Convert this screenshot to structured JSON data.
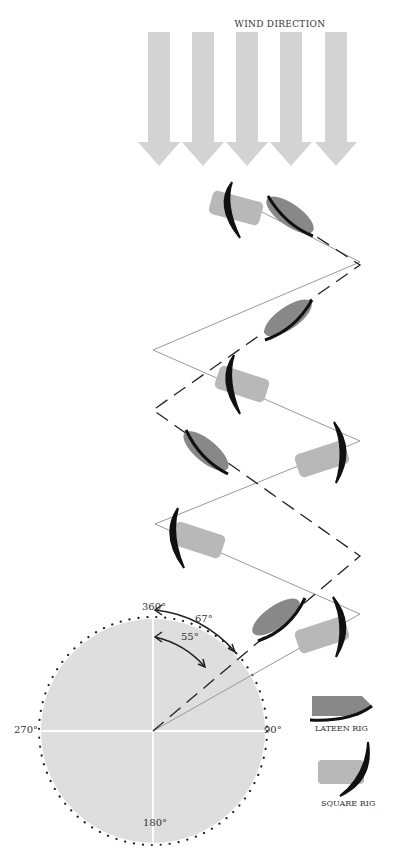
{
  "diagram": {
    "title": "WIND DIRECTION",
    "wind_arrows": 5,
    "compass": {
      "labels": {
        "north": "360°",
        "east": "90°",
        "south": "180°",
        "west": "270°"
      },
      "angles": [
        {
          "label": "55°",
          "value": 55
        },
        {
          "label": "67°",
          "value": 67
        }
      ]
    },
    "legend": [
      {
        "label": "LATEEN RIG",
        "icon": "lateen-rig-icon"
      },
      {
        "label": "SQUARE RIG",
        "icon": "square-rig-icon"
      }
    ],
    "paths": {
      "lateen_rig": "dashed zigzag tacking path",
      "square_rig": "thin solid zigzag tacking path"
    },
    "colors": {
      "arrow": "#d4d4d4",
      "compass_fill": "#dcdcdc",
      "lateen_hull": "#888888",
      "square_hull": "#b8b8b8",
      "sail": "#111111"
    }
  }
}
